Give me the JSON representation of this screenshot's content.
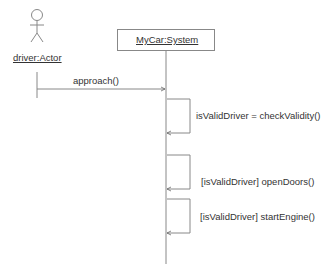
{
  "diagram": {
    "type": "uml-sequence",
    "participants": [
      {
        "id": "driver",
        "label": "driver:Actor",
        "kind": "actor"
      },
      {
        "id": "system",
        "label": "MyCar:System",
        "kind": "object"
      }
    ],
    "messages": [
      {
        "from": "driver",
        "to": "system",
        "label": "approach()"
      },
      {
        "from": "system",
        "to": "system",
        "label": "isValidDriver = checkValidity()"
      },
      {
        "from": "system",
        "to": "system",
        "label": "[isValidDriver] openDoors()"
      },
      {
        "from": "system",
        "to": "system",
        "label": "[isValidDriver] startEngine()"
      }
    ],
    "colors": {
      "line": "#888888",
      "text": "#333333",
      "background": "#ffffff"
    }
  }
}
